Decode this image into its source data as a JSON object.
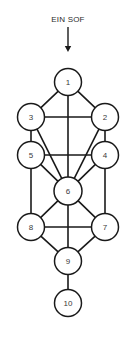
{
  "diagram": {
    "source_label": {
      "text": "EIN SOF",
      "x": 68,
      "y": 22
    },
    "arrow": {
      "name": "downward-arrow",
      "x": 68,
      "y_start": 27,
      "y_end": 52
    },
    "colors": {
      "stroke": "#1a1a1a",
      "fill": "#ffffff",
      "label": "#3a3a3a",
      "background": "#ffffff"
    },
    "node_radius": 13.5,
    "nodes": [
      {
        "id": "1",
        "label": "1",
        "cx": 68,
        "cy": 82,
        "r": 13.5
      },
      {
        "id": "2",
        "label": "2",
        "cx": 105,
        "cy": 117,
        "r": 13.5
      },
      {
        "id": "3",
        "label": "3",
        "cx": 31,
        "cy": 117,
        "r": 13.5
      },
      {
        "id": "4",
        "label": "4",
        "cx": 105,
        "cy": 155,
        "r": 13.5
      },
      {
        "id": "5",
        "label": "5",
        "cx": 31,
        "cy": 155,
        "r": 13.5
      },
      {
        "id": "6",
        "label": "6",
        "cx": 68,
        "cy": 191,
        "r": 14.0
      },
      {
        "id": "7",
        "label": "7",
        "cx": 105,
        "cy": 227,
        "r": 13.5
      },
      {
        "id": "8",
        "label": "8",
        "cx": 31,
        "cy": 227,
        "r": 13.5
      },
      {
        "id": "9",
        "label": "9",
        "cx": 68,
        "cy": 261,
        "r": 13.5
      },
      {
        "id": "10",
        "label": "10",
        "cx": 68,
        "cy": 303,
        "r": 13.5
      }
    ],
    "edges": [
      {
        "from": "1",
        "to": "2"
      },
      {
        "from": "1",
        "to": "3"
      },
      {
        "from": "1",
        "to": "6"
      },
      {
        "from": "3",
        "to": "2"
      },
      {
        "from": "3",
        "to": "5"
      },
      {
        "from": "3",
        "to": "6"
      },
      {
        "from": "2",
        "to": "4"
      },
      {
        "from": "2",
        "to": "6"
      },
      {
        "from": "5",
        "to": "4"
      },
      {
        "from": "5",
        "to": "6"
      },
      {
        "from": "5",
        "to": "8"
      },
      {
        "from": "4",
        "to": "6"
      },
      {
        "from": "4",
        "to": "7"
      },
      {
        "from": "6",
        "to": "8"
      },
      {
        "from": "6",
        "to": "7"
      },
      {
        "from": "6",
        "to": "9"
      },
      {
        "from": "8",
        "to": "7"
      },
      {
        "from": "8",
        "to": "9"
      },
      {
        "from": "7",
        "to": "9"
      },
      {
        "from": "9",
        "to": "10"
      }
    ]
  }
}
